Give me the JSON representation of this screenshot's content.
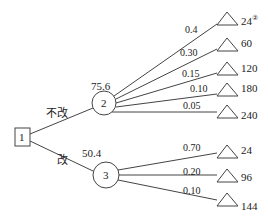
{
  "decision_node": {
    "label": "1"
  },
  "branches": [
    {
      "label": "不改",
      "expected_value": "75.6",
      "chance_node": "2",
      "outcomes": [
        {
          "probability": "0.4",
          "payoff": "24",
          "note": "②"
        },
        {
          "probability": "0.30",
          "payoff": "60"
        },
        {
          "probability": "0.15",
          "payoff": "120"
        },
        {
          "probability": "0.10",
          "payoff": "180"
        },
        {
          "probability": "0.05",
          "payoff": "240"
        }
      ]
    },
    {
      "label": "改",
      "expected_value": "50.4",
      "chance_node": "3",
      "outcomes": [
        {
          "probability": "0.70",
          "payoff": "24"
        },
        {
          "probability": "0.20",
          "payoff": "96"
        },
        {
          "probability": "0.10",
          "payoff": "144"
        }
      ]
    }
  ],
  "colors": {
    "line": "#444444",
    "text": "#222222",
    "background": "#ffffff"
  }
}
